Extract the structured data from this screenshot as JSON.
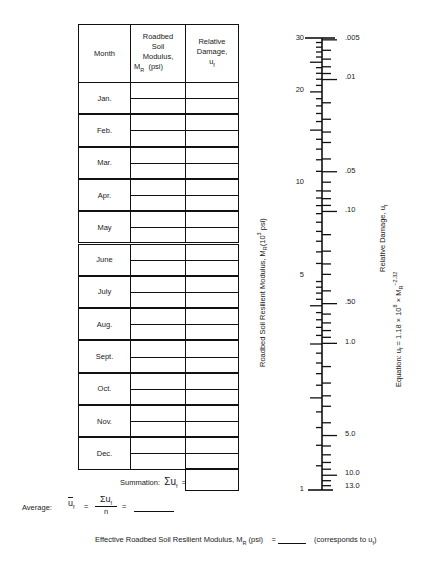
{
  "table": {
    "headers": {
      "month": "Month",
      "modulus": [
        "Roadbed",
        "Soil",
        "Modulus,",
        "M",
        "R",
        "(psi)"
      ],
      "damage": [
        "Relative",
        "Damage,",
        "u",
        "f"
      ]
    },
    "months": [
      "Jan.",
      "Feb.",
      "Mar.",
      "Apr.",
      "May",
      "June",
      "July",
      "Aug.",
      "Sept.",
      "Oct.",
      "Nov.",
      "Dec."
    ],
    "summation_label": "Summation:",
    "summation_symbol": "Σu",
    "summation_sub": "f",
    "summation_eq": "="
  },
  "average": {
    "label": "Average:",
    "symbol": "u",
    "sub": "f",
    "eq": "=",
    "numerator": "Σu",
    "numerator_sub": "f",
    "denominator": "n",
    "eq2": "="
  },
  "effective": {
    "label": "Effective Roadbed Soil Resilient Modulus, M",
    "label_sub": "R",
    "label_unit": "(psi)",
    "eq": "=",
    "note": "(corresponds to u",
    "note_sub": "f",
    "note_end": ")"
  },
  "nomograph": {
    "left_axis_title": "Roadbed Soil Resilient Modulus, M",
    "left_axis_sub": "R",
    "left_axis_unit_pre": "(10",
    "left_axis_unit_sup": "3",
    "left_axis_unit_post": " psi)",
    "right_axis_title": "Relative Damage, u",
    "right_axis_sub": "f",
    "equation_pre": "Equation: u",
    "equation_sub": "f",
    "equation_mid": " = 1.18 × 10",
    "equation_sup": "8",
    "equation_x": " × M",
    "equation_sub2": "R",
    "equation_sup2": "−2.32",
    "left_labels": [
      {
        "text": "30",
        "y": 38
      },
      {
        "text": "20",
        "y": 90
      },
      {
        "text": "10",
        "y": 182
      },
      {
        "text": "5",
        "y": 275
      },
      {
        "text": "1",
        "y": 489
      }
    ],
    "right_labels": [
      {
        "text": ".005",
        "y": 38
      },
      {
        "text": ".01",
        "y": 77
      },
      {
        "text": ".05",
        "y": 171
      },
      {
        "text": ".10",
        "y": 210
      },
      {
        "text": ".50",
        "y": 302
      },
      {
        "text": "1.0",
        "y": 342
      },
      {
        "text": "5.0",
        "y": 434
      },
      {
        "text": "10.0",
        "y": 473
      },
      {
        "text": "13.0",
        "y": 486
      }
    ]
  }
}
